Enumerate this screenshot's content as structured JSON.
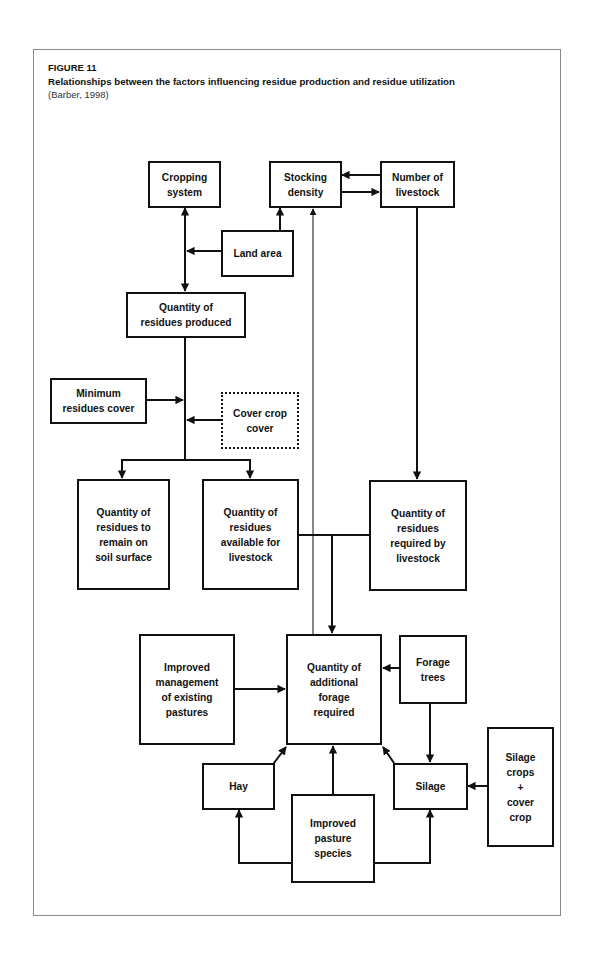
{
  "figure": {
    "label": "FIGURE 11",
    "title": "Relationships between the factors influencing residue production and residue utilization",
    "source": "(Barber, 1998)"
  },
  "nodes": {
    "cropping_system": "Cropping\nsystem",
    "stocking_density": "Stocking\ndensity",
    "number_of_livestock": "Number of\nlivestock",
    "land_area": "Land area",
    "residues_produced": "Quantity of\nresidues produced",
    "minimum_residues_cover": "Minimum\nresidues cover",
    "cover_crop_cover": "Cover crop\ncover",
    "residues_remain": "Quantity of\nresidues to\nremain on\nsoil surface",
    "residues_available": "Quantity of\nresidues\navailable for\nlivestock",
    "residues_required": "Quantity of\nresidues\nrequired by\nlivestock",
    "improved_management": "Improved\nmanagement\nof existing\npastures",
    "additional_forage": "Quantity of\nadditional\nforage\nrequired",
    "forage_trees": "Forage\ntrees",
    "hay": "Hay",
    "silage": "Silage",
    "improved_pasture_species": "Improved\npasture\nspecies",
    "silage_crops": "Silage\ncrops\n+\ncover\ncrop"
  },
  "edges": [
    {
      "from": "cropping_system",
      "to": "residues_produced",
      "type": "bidirectional"
    },
    {
      "from": "land_area",
      "to": "cropping_system-residues_produced link"
    },
    {
      "from": "land_area",
      "to": "stocking_density"
    },
    {
      "from": "number_of_livestock",
      "to": "stocking_density"
    },
    {
      "from": "stocking_density",
      "to": "number_of_livestock"
    },
    {
      "from": "additional_forage",
      "to": "stocking_density",
      "style": "thin"
    },
    {
      "from": "minimum_residues_cover",
      "to": "residues_produced line"
    },
    {
      "from": "cover_crop_cover",
      "to": "residues_produced line"
    },
    {
      "from": "residues_produced",
      "to": "residues_remain"
    },
    {
      "from": "residues_produced",
      "to": "residues_available"
    },
    {
      "from": "number_of_livestock",
      "to": "residues_required"
    },
    {
      "from": "residues_available + residues_required",
      "to": "additional_forage"
    },
    {
      "from": "improved_management",
      "to": "additional_forage"
    },
    {
      "from": "forage_trees",
      "to": "additional_forage"
    },
    {
      "from": "forage_trees",
      "to": "silage"
    },
    {
      "from": "hay",
      "to": "additional_forage"
    },
    {
      "from": "improved_pasture_species",
      "to": "additional_forage"
    },
    {
      "from": "silage",
      "to": "additional_forage"
    },
    {
      "from": "improved_pasture_species",
      "to": "hay"
    },
    {
      "from": "improved_pasture_species",
      "to": "silage"
    },
    {
      "from": "silage_crops",
      "to": "silage"
    }
  ],
  "colors": {
    "line": "#111111",
    "frame": "#8a8a8a",
    "background": "#ffffff"
  }
}
